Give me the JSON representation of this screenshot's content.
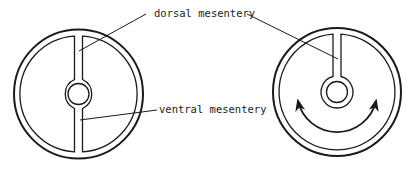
{
  "figure": {
    "labels": {
      "dorsal": "dorsal mesentery",
      "ventral": "ventral mesentery"
    },
    "panels": [
      {
        "id": "left",
        "description": "Cross-section with dorsal and ventral mesentery intact"
      },
      {
        "id": "right",
        "description": "Cross-section with dorsal mesentery only; ventral mesentery gone, arrows indicate continuous cavity"
      }
    ],
    "colors": {
      "stroke": "#1a1a1a",
      "background": "#ffffff"
    }
  }
}
